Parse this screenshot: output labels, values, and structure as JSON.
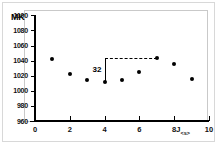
{
  "chart_data": {
    "type": "scatter",
    "title": "",
    "xlabel": "J",
    "xlabel_sub": "<s>",
    "ylabel": "MK",
    "xlim": [
      0,
      10
    ],
    "ylim": [
      960,
      1100
    ],
    "grid": false,
    "legend": "none",
    "x": [
      1,
      2,
      3,
      4,
      5,
      6,
      7,
      8,
      9
    ],
    "values": [
      1042,
      1022,
      1014,
      1012,
      1014,
      1025,
      1043,
      1035,
      1015
    ],
    "xticks": [
      "0",
      "2",
      "4",
      "6",
      "8",
      "10"
    ],
    "xtick_values": [
      0,
      2,
      4,
      6,
      8,
      10
    ],
    "yticks": [
      "960",
      "980",
      "1000",
      "1020",
      "1040",
      "1060",
      "1080",
      "1100"
    ],
    "ytick_values": [
      960,
      980,
      1000,
      1020,
      1040,
      1060,
      1080,
      1100
    ],
    "annotations": [
      {
        "label": "32",
        "x_from": 4,
        "x_to": 7,
        "y_from": 1012,
        "y_to": 1043,
        "style": "vertical-line-with-dashed-horizontal"
      }
    ]
  },
  "axis": {
    "y_title": "MK",
    "x_title": "J",
    "x_title_sub": "<s>"
  },
  "annotation": {
    "value_label": "32"
  }
}
